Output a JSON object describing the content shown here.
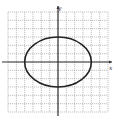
{
  "chart_data": {
    "type": "line",
    "title": "",
    "xlabel": "x",
    "ylabel": "y",
    "xlim": [
      -6,
      6
    ],
    "ylim": [
      -6,
      6
    ],
    "grid": true,
    "grid_style": "dashed",
    "series": [
      {
        "name": "ellipse",
        "shape": "ellipse",
        "center": [
          0,
          0
        ],
        "semi_axis_x": 4,
        "semi_axis_y": 3,
        "equation": "x^2/16 + y^2/9 = 1",
        "color": "#222222"
      }
    ]
  },
  "labels": {
    "x_axis": "x",
    "y_axis": "y"
  },
  "colors": {
    "grid": "#9a9a9a",
    "axis": "#333333",
    "curve": "#222222"
  }
}
